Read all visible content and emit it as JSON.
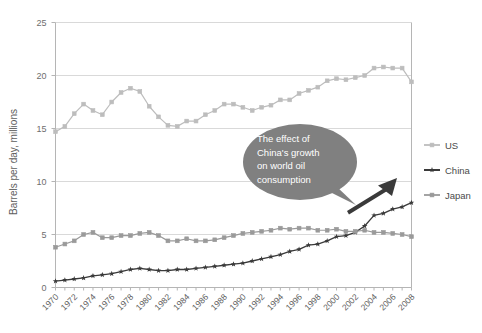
{
  "chart_data": {
    "type": "line",
    "title": "",
    "xlabel": "",
    "ylabel": "Barrels per day, millions",
    "ylim": [
      0,
      25
    ],
    "yticks": [
      0,
      5,
      10,
      15,
      20,
      25
    ],
    "ytick_labels": [
      "0",
      "5",
      "10",
      "15",
      "20",
      "25"
    ],
    "grid": true,
    "grid_axis": "y",
    "legend_position": "right",
    "x": [
      1970,
      1971,
      1972,
      1973,
      1974,
      1975,
      1976,
      1977,
      1978,
      1979,
      1980,
      1981,
      1982,
      1983,
      1984,
      1985,
      1986,
      1987,
      1988,
      1989,
      1990,
      1991,
      1992,
      1993,
      1994,
      1995,
      1996,
      1997,
      1998,
      1999,
      2000,
      2001,
      2002,
      2003,
      2004,
      2005,
      2006,
      2007,
      2008
    ],
    "xtick_labels": [
      "1970",
      "1972",
      "1974",
      "1976",
      "1978",
      "1980",
      "1982",
      "1984",
      "1986",
      "1988",
      "1990",
      "1992",
      "1994",
      "1996",
      "1998",
      "2000",
      "2002",
      "2004",
      "2006",
      "2008"
    ],
    "xtick_rotation": 45,
    "series": [
      {
        "name": "US",
        "color": "#bdbdbd",
        "marker": "square",
        "values": [
          14.7,
          15.2,
          16.4,
          17.3,
          16.7,
          16.3,
          17.5,
          18.4,
          18.8,
          18.5,
          17.1,
          16.1,
          15.3,
          15.2,
          15.7,
          15.7,
          16.3,
          16.7,
          17.3,
          17.3,
          17.0,
          16.7,
          17.0,
          17.2,
          17.7,
          17.7,
          18.3,
          18.6,
          18.9,
          19.5,
          19.7,
          19.6,
          19.8,
          20.0,
          20.7,
          20.8,
          20.7,
          20.7,
          19.4
        ]
      },
      {
        "name": "China",
        "color": "#3a3a3a",
        "marker": "star",
        "values": [
          0.6,
          0.7,
          0.8,
          0.9,
          1.1,
          1.2,
          1.3,
          1.5,
          1.7,
          1.8,
          1.7,
          1.6,
          1.6,
          1.7,
          1.7,
          1.8,
          1.9,
          2.0,
          2.1,
          2.2,
          2.3,
          2.5,
          2.7,
          2.9,
          3.1,
          3.4,
          3.6,
          4.0,
          4.1,
          4.4,
          4.8,
          4.9,
          5.2,
          5.8,
          6.8,
          7.0,
          7.4,
          7.6,
          8.0
        ]
      },
      {
        "name": "Japan",
        "color": "#9a9a9a",
        "marker": "square",
        "values": [
          3.8,
          4.1,
          4.4,
          5.0,
          5.2,
          4.7,
          4.7,
          4.9,
          4.9,
          5.1,
          5.2,
          4.9,
          4.4,
          4.4,
          4.6,
          4.4,
          4.4,
          4.5,
          4.7,
          4.9,
          5.1,
          5.2,
          5.3,
          5.4,
          5.6,
          5.5,
          5.6,
          5.6,
          5.4,
          5.4,
          5.5,
          5.3,
          5.3,
          5.4,
          5.2,
          5.2,
          5.1,
          5.0,
          4.8
        ]
      }
    ],
    "annotations": [
      {
        "type": "callout",
        "text_lines": [
          "The effect of",
          "China's growth",
          "on world oil",
          "consumption"
        ],
        "full_text": "The effect of China's growth on world oil consumption",
        "fill": "#808080",
        "text_color": "#ffffff"
      },
      {
        "type": "arrow",
        "color": "#3a3a3a",
        "points_to": "china-series-rise"
      }
    ]
  },
  "legend": {
    "items": [
      {
        "label": "US",
        "color": "#bdbdbd",
        "marker": "square"
      },
      {
        "label": "China",
        "color": "#3a3a3a",
        "marker": "star"
      },
      {
        "label": "Japan",
        "color": "#9a9a9a",
        "marker": "square"
      }
    ]
  },
  "colors": {
    "background": "#ffffff",
    "gridline": "#d9d9d9",
    "axis": "#b5b5b5",
    "text": "#5d5d5d"
  }
}
